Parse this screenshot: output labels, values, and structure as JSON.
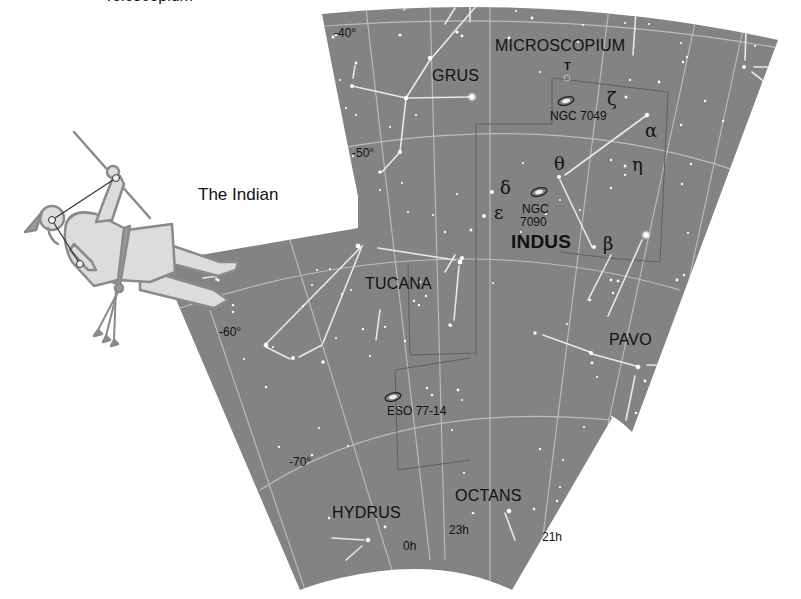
{
  "figure": {
    "caption_top_cut": "Telescopium",
    "figure_label": "The Indian"
  },
  "colors": {
    "sky": "#838383",
    "grid": "#b9b9b9",
    "constellation_line": "#e6e6e6",
    "star": "#ffffff",
    "boundary": "#6a6a6a",
    "text": "#111111",
    "figure_fill": "#dcdcdc",
    "figure_stroke": "#8a8a8a"
  },
  "constellations": [
    {
      "name": "MICROSCOPIUM"
    },
    {
      "name": "GRUS"
    },
    {
      "name": "INDUS"
    },
    {
      "name": "TUCANA"
    },
    {
      "name": "PAVO"
    },
    {
      "name": "HYDRUS"
    },
    {
      "name": "OCTANS"
    }
  ],
  "declinations": [
    "-40°",
    "-50°",
    "-60°",
    "-70°"
  ],
  "right_ascensions": [
    "0h",
    "23h",
    "21h"
  ],
  "deep_sky_objects": [
    {
      "name": "NGC 7049"
    },
    {
      "name_line1": "NGC",
      "name_line2": "7090"
    },
    {
      "name": "ESO 77-14"
    }
  ],
  "star_labels": {
    "T": "T",
    "zeta": "ζ",
    "alpha": "α",
    "eta": "η",
    "theta": "θ",
    "delta": "δ",
    "epsilon": "ε",
    "beta": "β"
  }
}
